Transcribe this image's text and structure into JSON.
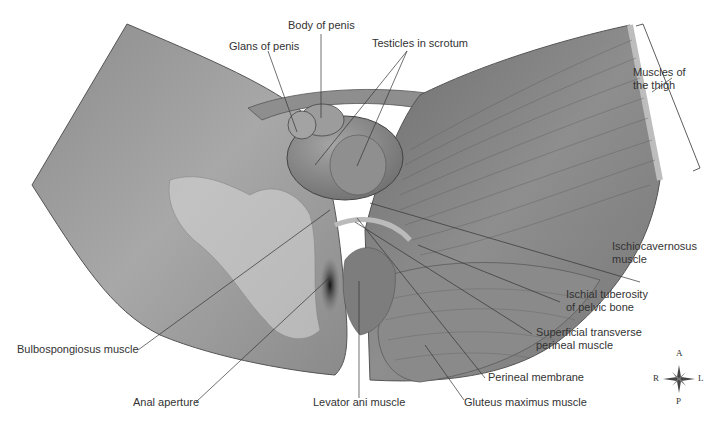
{
  "figure": {
    "colors": {
      "background": "#ffffff",
      "skin": "#9a9a9a",
      "skin_dark": "#6e6e6e",
      "muscle": "#858585",
      "bone": "#d6d6d6",
      "leader_line": "#333333",
      "text": "#333333"
    }
  },
  "labels": {
    "body_of_penis": "Body of penis",
    "glans_of_penis": "Glans of penis",
    "testicles_in_scrotum": "Testicles in scrotum",
    "muscles_of_thigh_line1": "Muscles of",
    "muscles_of_thigh_line2": "the thigh",
    "ischiocavernosus_line1": "Ischiocavernosus",
    "ischiocavernosus_line2": "muscle",
    "ischial_tuberosity_line1": "Ischial tuberosity",
    "ischial_tuberosity_line2": "of pelvic bone",
    "superficial_transverse_line1": "Superficial transverse",
    "superficial_transverse_line2": "perineal muscle",
    "bulbospongiosus": "Bulbospongiosus muscle",
    "perineal_membrane": "Perineal membrane",
    "anal_aperture": "Anal aperture",
    "levator_ani": "Levator ani muscle",
    "gluteus_maximus": "Gluteus maximus muscle"
  },
  "compass": {
    "top": "A",
    "bottom": "P",
    "left": "R",
    "right": "L"
  }
}
